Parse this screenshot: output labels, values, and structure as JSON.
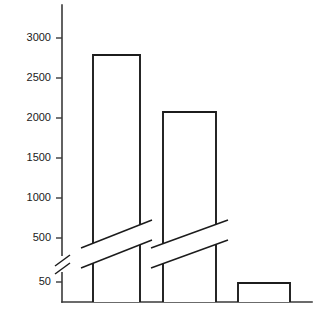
{
  "chart_data": {
    "type": "bar",
    "title": "",
    "subtitle": "",
    "xlabel": "",
    "ylabel": "",
    "categories": [
      "Bar 1",
      "Bar 2",
      "Bar 3"
    ],
    "values": [
      2800,
      2090,
      50
    ],
    "ytick_labels": [
      "3000",
      "2500",
      "2000",
      "1500",
      "1000",
      "500",
      "50"
    ],
    "ytick_values": [
      3000,
      2500,
      2000,
      1500,
      1000,
      500,
      50
    ],
    "ylim": [
      0,
      3400
    ],
    "grid": "off",
    "legend": "none",
    "axis_break": {
      "present": true,
      "between": [
        50,
        500
      ],
      "marker": "double-diagonal-slash",
      "bars_broken": [
        "Bar 1",
        "Bar 2"
      ]
    },
    "annotations": [],
    "bar_style": {
      "fill": "#ffffff",
      "outline": "#1c1c1c",
      "outline_width": 1.9
    }
  },
  "axis": {
    "line_color": "#3a3a3a",
    "tick_color": "#3a3a3a",
    "label_color": "#1a1a1a",
    "ticks": [
      {
        "label": "3000",
        "y": 38
      },
      {
        "label": "2500",
        "y": 78
      },
      {
        "label": "2000",
        "y": 118
      },
      {
        "label": "1500",
        "y": 158
      },
      {
        "label": "1000",
        "y": 198
      },
      {
        "label": "500",
        "y": 238
      },
      {
        "label": "50",
        "y": 282
      }
    ]
  },
  "bars": [
    {
      "name": "bar-1",
      "label": "Bar 1",
      "value": 2800,
      "x": 93,
      "width": 47,
      "top": 55,
      "has_break": true
    },
    {
      "name": "bar-2",
      "label": "Bar 2",
      "value": 2090,
      "x": 163,
      "width": 53,
      "top": 112,
      "has_break": true
    },
    {
      "name": "bar-3",
      "label": "Bar 3",
      "value": 50,
      "x": 238,
      "width": 52,
      "top": 283,
      "has_break": false
    }
  ],
  "geometry": {
    "axis_x": 62,
    "axis_top": 5,
    "baseline_y": 302,
    "baseline_right": 312,
    "tick_length": 6
  }
}
